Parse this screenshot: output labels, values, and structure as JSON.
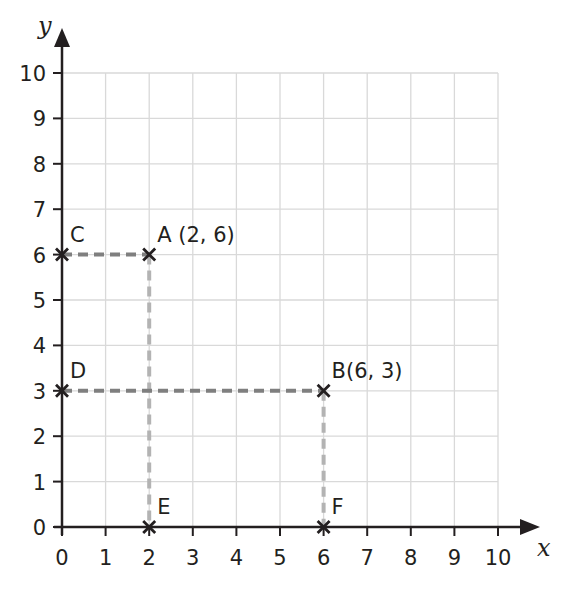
{
  "chart_data": {
    "type": "scatter",
    "title": "",
    "xlabel": "x",
    "ylabel": "y",
    "xlim": [
      0,
      10
    ],
    "ylim": [
      0,
      10
    ],
    "grid": true,
    "x_ticks": [
      "0",
      "1",
      "2",
      "3",
      "4",
      "5",
      "6",
      "7",
      "8",
      "9",
      "10"
    ],
    "y_ticks": [
      "0",
      "1",
      "2",
      "3",
      "4",
      "5",
      "6",
      "7",
      "8",
      "9",
      "10"
    ],
    "points": [
      {
        "name": "A",
        "label": "A (2, 6)",
        "x": 2,
        "y": 6
      },
      {
        "name": "B",
        "label": "B(6, 3)",
        "x": 6,
        "y": 3
      },
      {
        "name": "C",
        "label": "C",
        "x": 0,
        "y": 6
      },
      {
        "name": "D",
        "label": "D",
        "x": 0,
        "y": 3
      },
      {
        "name": "E",
        "label": "E",
        "x": 2,
        "y": 0
      },
      {
        "name": "F",
        "label": "F",
        "x": 6,
        "y": 0
      }
    ],
    "dashed_lines": [
      {
        "from": "C",
        "to": "A",
        "color": "#7f7f7f"
      },
      {
        "from": "A",
        "to": "E",
        "color": "#b3b3b3"
      },
      {
        "from": "D",
        "to": "B",
        "color": "#7f7f7f"
      },
      {
        "from": "B",
        "to": "F",
        "color": "#b3b3b3"
      }
    ],
    "colors": {
      "axis": "#231f20",
      "grid": "#d9d9d9",
      "dash_horizontal": "#7f7f7f",
      "dash_vertical": "#b3b3b3"
    }
  }
}
